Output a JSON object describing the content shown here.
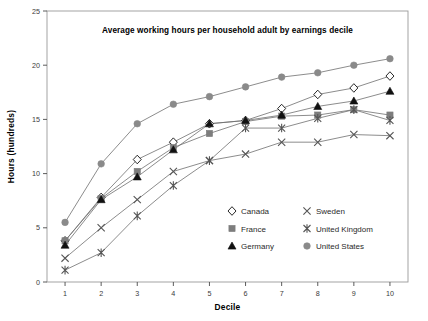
{
  "chart_data": {
    "type": "line",
    "title": "Average working hours per household adult by earnings decile",
    "xlabel": "Decile",
    "ylabel": "Hours (hundreds)",
    "categories": [
      "1",
      "2",
      "3",
      "4",
      "5",
      "6",
      "7",
      "8",
      "9",
      "10"
    ],
    "x": [
      1,
      2,
      3,
      4,
      5,
      6,
      7,
      8,
      9,
      10
    ],
    "xlim": [
      0.5,
      10.5
    ],
    "ylim": [
      0,
      25
    ],
    "yticks": [
      0,
      5,
      10,
      15,
      20,
      25
    ],
    "xticks": [
      1,
      2,
      3,
      4,
      5,
      6,
      7,
      8,
      9,
      10
    ],
    "grid": false,
    "legend_position": "inside-bottom-right",
    "series": [
      {
        "name": "Canada",
        "marker": "open-diamond",
        "color": "#1a1a1a",
        "fill": "#ffffff",
        "values": [
          3.8,
          7.8,
          11.3,
          12.9,
          14.6,
          14.9,
          16.0,
          17.3,
          17.9,
          19.0
        ]
      },
      {
        "name": "France",
        "marker": "filled-square",
        "color": "#7d7d7d",
        "fill": "#7d7d7d",
        "values": [
          3.8,
          7.7,
          10.2,
          12.4,
          13.7,
          14.8,
          15.3,
          15.4,
          15.9,
          15.4
        ]
      },
      {
        "name": "Germany",
        "marker": "filled-triangle",
        "color": "#111111",
        "fill": "#111111",
        "values": [
          3.4,
          7.6,
          9.7,
          12.2,
          14.6,
          14.9,
          15.4,
          16.2,
          16.7,
          17.6
        ]
      },
      {
        "name": "Sweden",
        "marker": "cross-x",
        "color": "#555555",
        "fill": "none",
        "values": [
          2.2,
          5.0,
          7.6,
          10.2,
          11.2,
          11.8,
          12.9,
          12.9,
          13.6,
          13.5
        ]
      },
      {
        "name": "United Kingdom",
        "marker": "asterisk",
        "color": "#555555",
        "fill": "none",
        "values": [
          1.1,
          2.7,
          6.1,
          8.9,
          11.2,
          14.2,
          14.2,
          15.1,
          15.9,
          14.9
        ]
      },
      {
        "name": "United States",
        "marker": "filled-circle",
        "color": "#8a8a8a",
        "fill": "#8a8a8a",
        "values": [
          5.5,
          10.9,
          14.6,
          16.4,
          17.1,
          18.0,
          18.9,
          19.3,
          20.0,
          20.6
        ]
      }
    ]
  },
  "legend": {
    "entries": [
      {
        "label": "Canada"
      },
      {
        "label": "Sweden"
      },
      {
        "label": "France"
      },
      {
        "label": "United Kingdom"
      },
      {
        "label": "Germany"
      },
      {
        "label": "United States"
      }
    ]
  },
  "colors": {
    "axis": "#4a4a4a",
    "frame": "#9a9a9a",
    "text": "#1a1a1a",
    "gray_marker": "#8a8a8a",
    "dark_marker": "#111111",
    "line": "#6f6f6f",
    "background": "#ffffff"
  }
}
